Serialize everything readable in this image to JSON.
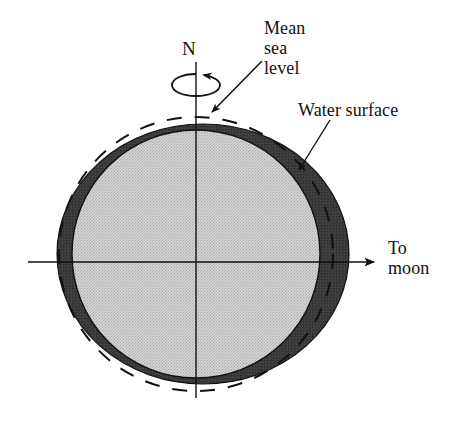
{
  "figure": {
    "type": "diagram",
    "width": 463,
    "height": 424
  },
  "labels": {
    "north_pole": "N",
    "mean_sea_level": "Mean\nsea\nlevel",
    "mean_sea_level_line1": "Mean",
    "mean_sea_level_line2": "sea",
    "mean_sea_level_line3": "level",
    "water_surface": "Water surface",
    "to_moon": "To\nmoon",
    "to_moon_line1": "To",
    "to_moon_line2": "moon"
  },
  "colors": {
    "earth_fill": "#c9c9c9",
    "water_fill": "#3a3a3a",
    "stroke": "#111111",
    "background": "#ffffff"
  },
  "geometry": {
    "earth": {
      "cx": 196,
      "cy": 254,
      "r": 124
    },
    "water_surface_ellipse": {
      "cx": 203,
      "cy": 254,
      "rx": 146,
      "ry": 130
    },
    "mean_sea_level_circle": {
      "cx": 196,
      "cy": 254,
      "r": 137,
      "dashed": true
    },
    "rotation_axis": {
      "x": 196,
      "y_top": 62,
      "y_bottom": 398
    },
    "equator_axis": {
      "y": 262,
      "x_left": 28,
      "x_right": 378
    },
    "to_moon_arrow": {
      "x_start": 345,
      "x_end": 378,
      "y": 262
    },
    "spin_ellipse": {
      "cx": 196,
      "cy": 85,
      "rx": 24,
      "ry": 11
    }
  },
  "annotations": [
    {
      "name": "mean-sea-level-leader",
      "from": [
        262,
        62
      ],
      "to": [
        209,
        116
      ]
    },
    {
      "name": "water-surface-leader",
      "from": [
        330,
        121
      ],
      "to": [
        297,
        174
      ]
    }
  ]
}
